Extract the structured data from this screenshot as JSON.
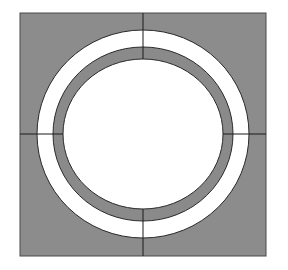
{
  "diagram": {
    "colors": {
      "background": "#ffffff",
      "fill_gray": "#8c8c8c",
      "ring_gray": "#8a8a8a",
      "white": "#ffffff",
      "outline": "#2a2a2a"
    },
    "square": {
      "x": 20,
      "y": 13,
      "width": 246,
      "height": 243
    },
    "center": {
      "cx": 143,
      "cy": 134
    },
    "outer_white_ring": {
      "rx": 106,
      "ry": 104
    },
    "gray_ring_outer": {
      "rx": 90,
      "ry": 87
    },
    "inner_white_circle": {
      "rx": 80,
      "ry": 75
    }
  }
}
